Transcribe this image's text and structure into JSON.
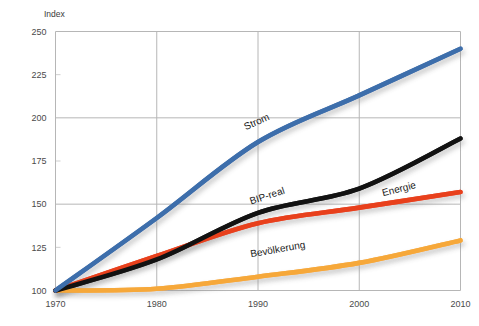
{
  "chart_data": {
    "type": "line",
    "title": "",
    "subtitle": "",
    "xlabel": "",
    "ylabel": "Index",
    "x": [
      1970,
      1980,
      1990,
      2000,
      2010
    ],
    "xticklabels": [
      "1970",
      "1980",
      "1990",
      "2000",
      "2010"
    ],
    "xlim": [
      1970,
      2010
    ],
    "ylim": [
      100,
      250
    ],
    "yticks": [
      100,
      125,
      150,
      175,
      200,
      225,
      250
    ],
    "yticklabels": [
      "100",
      "125",
      "150",
      "175",
      "200",
      "225",
      "250"
    ],
    "grid": true,
    "gridlines_major_y": [
      150,
      200,
      250
    ],
    "gridlines_minor_y": [
      125,
      175,
      225
    ],
    "legend": "inline-labels",
    "series": [
      {
        "name": "Strom",
        "color": "#3d6eab",
        "values": [
          100,
          142,
          186,
          213,
          240
        ],
        "label_x": 1990,
        "label_value": 196,
        "label_angle": -24
      },
      {
        "name": "BIP-real",
        "color": "#121212",
        "values": [
          100,
          118,
          145,
          159,
          188
        ],
        "label_x": 1991,
        "label_value": 153,
        "label_angle": -18
      },
      {
        "name": "Energie",
        "color": "#e8401c",
        "values": [
          100,
          120,
          139,
          148,
          157
        ],
        "label_x": 2004,
        "label_value": 157,
        "label_angle": -14
      },
      {
        "name": "Bevölkerung",
        "color": "#f6a83a",
        "values": [
          100,
          101,
          108,
          116,
          129
        ],
        "label_x": 1992,
        "label_value": 122,
        "label_angle": -10
      }
    ]
  },
  "axes": {
    "y_axis_title": "Index"
  },
  "labels": {
    "strom": "Strom",
    "bip_real": "BIP-real",
    "energie": "Energie",
    "bevoelkerung": "Bevölkerung"
  },
  "ticks": {
    "y": [
      "250",
      "225",
      "200",
      "175",
      "150",
      "125",
      "100"
    ],
    "x": [
      "1970",
      "1980",
      "1990",
      "2000",
      "2010"
    ]
  },
  "colors": {
    "strom": "#3d6eab",
    "bip_real": "#121212",
    "energie": "#e8401c",
    "bevoelkerung": "#f6a83a",
    "grid_major": "#b6b6b6",
    "grid_minor": "#cfcfcf",
    "text": "#404040"
  }
}
